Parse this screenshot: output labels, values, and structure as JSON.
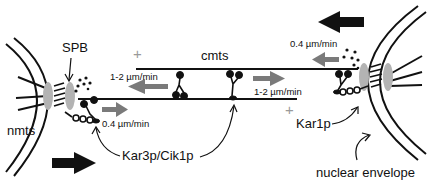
{
  "labels": {
    "spb": "SPB",
    "cmts": "cmts",
    "nmts": "nmts",
    "kar3": "Kar3p/Cik1p",
    "kar1": "Kar1p",
    "nuclear_envelope": "nuclear envelope"
  },
  "rates": {
    "left_spb_motion": "0.4 µm/min",
    "right_spb_motion": "0.4 µm/min",
    "upper_mt_motor": "1-2 µm/min",
    "lower_mt_motor": "1-2 µm/min"
  },
  "symbols": {
    "plus_end_upper": "+",
    "plus_end_lower": "+"
  },
  "colors": {
    "line": "#111111",
    "grey_arrow": "#7a7a7a",
    "spb_plaque": "#b3b3b3",
    "plus_sign": "#9a9a9a"
  }
}
